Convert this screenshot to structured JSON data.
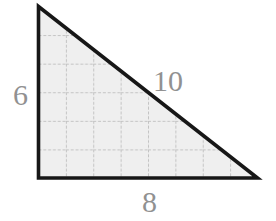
{
  "diagram": {
    "type": "right-triangle",
    "labels": {
      "vertical_leg": "6",
      "hypotenuse": "10",
      "horizontal_leg": "8"
    },
    "grid": {
      "columns": 8,
      "rows": 6
    },
    "colors": {
      "background": "#ffffff",
      "triangle_fill": "#efefef",
      "grid_line": "#c3c3c3",
      "outline": "#171717",
      "label_text": "#919191"
    }
  }
}
